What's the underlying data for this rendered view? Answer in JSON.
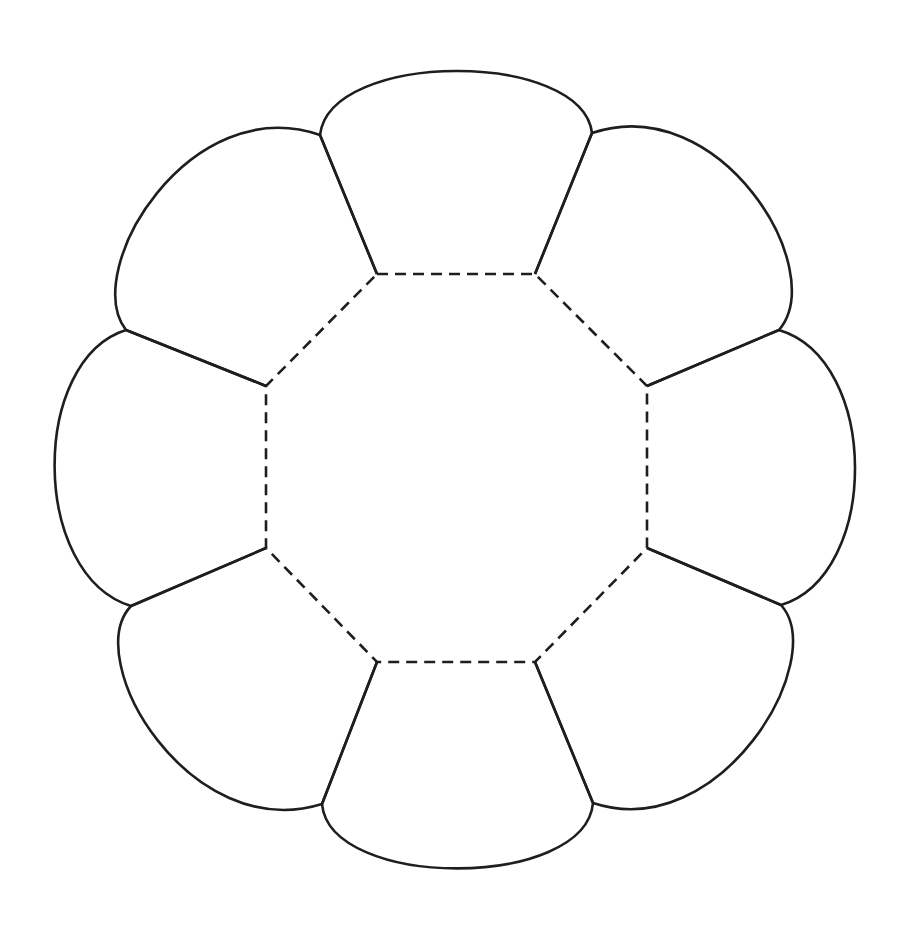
{
  "diagram": {
    "title": "",
    "type": "octagon-flower-net",
    "canvas": {
      "width": 907,
      "height": 933,
      "background": "#ffffff"
    },
    "stroke": {
      "color": "#1e1e1e",
      "solid_width": 2.6,
      "dashed_width": 2.6,
      "dash": "11 7"
    },
    "octagon": {
      "style": "dashed",
      "points": [
        [
          377,
          274
        ],
        [
          535,
          274
        ],
        [
          647,
          386
        ],
        [
          647,
          548
        ],
        [
          535,
          662
        ],
        [
          377,
          662
        ],
        [
          266,
          548
        ],
        [
          266,
          386
        ]
      ]
    },
    "petals": [
      {
        "name": "top",
        "a": [
          377,
          274
        ],
        "b": [
          535,
          274
        ],
        "outer_a": [
          320,
          135
        ],
        "outer_b": [
          592,
          133
        ],
        "c1": [
          330,
          50
        ],
        "c2": [
          582,
          50
        ]
      },
      {
        "name": "top-right",
        "a": [
          535,
          274
        ],
        "b": [
          647,
          386
        ],
        "outer_a": [
          592,
          133
        ],
        "outer_b": [
          779,
          330
        ],
        "c1": [
          720,
          90
        ],
        "c2": [
          830,
          270
        ]
      },
      {
        "name": "right",
        "a": [
          647,
          386
        ],
        "b": [
          647,
          548
        ],
        "outer_a": [
          779,
          330
        ],
        "outer_b": [
          781,
          605
        ],
        "c1": [
          880,
          360
        ],
        "c2": [
          880,
          575
        ]
      },
      {
        "name": "bottom-right",
        "a": [
          647,
          548
        ],
        "b": [
          535,
          662
        ],
        "outer_a": [
          781,
          605
        ],
        "outer_b": [
          593,
          803
        ],
        "c1": [
          830,
          660
        ],
        "c2": [
          720,
          845
        ]
      },
      {
        "name": "bottom",
        "a": [
          535,
          662
        ],
        "b": [
          377,
          662
        ],
        "outer_a": [
          593,
          803
        ],
        "outer_b": [
          322,
          804
        ],
        "c1": [
          585,
          890
        ],
        "c2": [
          330,
          890
        ]
      },
      {
        "name": "bottom-left",
        "a": [
          377,
          662
        ],
        "b": [
          266,
          548
        ],
        "outer_a": [
          322,
          804
        ],
        "outer_b": [
          131,
          606
        ],
        "c1": [
          190,
          845
        ],
        "c2": [
          80,
          660
        ]
      },
      {
        "name": "left",
        "a": [
          266,
          548
        ],
        "b": [
          266,
          386
        ],
        "outer_a": [
          131,
          606
        ],
        "outer_b": [
          126,
          330
        ],
        "c1": [
          30,
          575
        ],
        "c2": [
          30,
          360
        ]
      },
      {
        "name": "top-left",
        "a": [
          266,
          386
        ],
        "b": [
          377,
          274
        ],
        "outer_a": [
          126,
          330
        ],
        "outer_b": [
          320,
          135
        ],
        "c1": [
          80,
          270
        ],
        "c2": [
          190,
          90
        ]
      }
    ]
  }
}
